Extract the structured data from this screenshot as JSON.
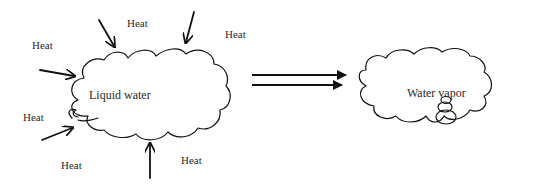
{
  "diagram": {
    "left_cloud": {
      "label": "Liquid water"
    },
    "right_cloud": {
      "label": "Water vapor"
    },
    "heat_labels": [
      "Heat",
      "Heat",
      "Heat",
      "Heat",
      "Heat",
      "Heat",
      "Heat"
    ],
    "transition": "double-arrow"
  }
}
